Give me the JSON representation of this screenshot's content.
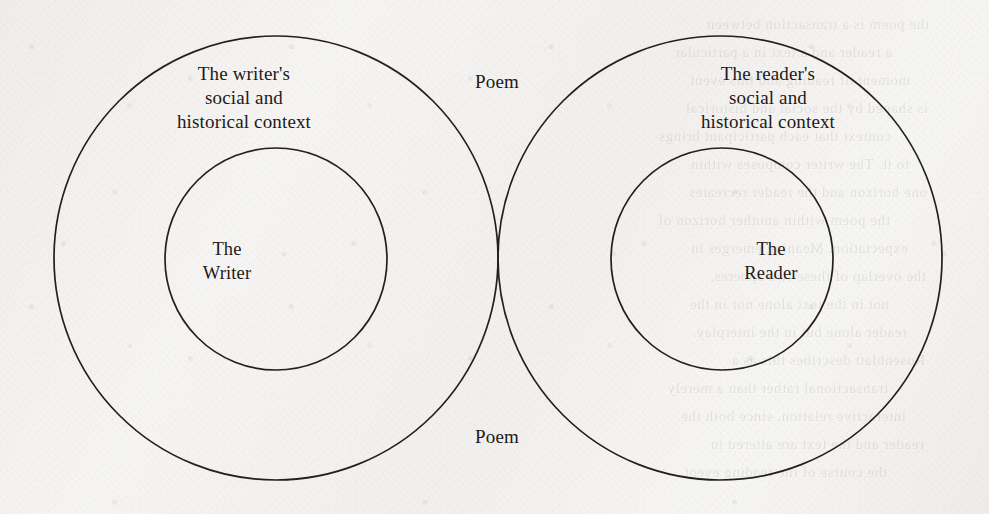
{
  "page": {
    "width": 989,
    "height": 514,
    "background_color": "#f3f2f0",
    "ink_color": "#23201e",
    "medium": "scanned book page"
  },
  "diagram": {
    "type": "venn-diagram",
    "title": "",
    "circles": [
      {
        "id": "writer-context",
        "label": "The writer's\nsocial and\nhistorical context",
        "cx": 276,
        "cy": 258,
        "r": 222,
        "role": "outer-left"
      },
      {
        "id": "reader-context",
        "label": "The reader's\nsocial and\nhistorical context",
        "cx": 720,
        "cy": 258,
        "r": 222,
        "role": "outer-right"
      },
      {
        "id": "writer",
        "label": "The\nWriter",
        "cx": 276,
        "cy": 259,
        "r": 111,
        "role": "inner-left"
      },
      {
        "id": "reader",
        "label": "The\nReader",
        "cx": 722,
        "cy": 259,
        "r": 111,
        "role": "inner-right"
      }
    ],
    "labels": [
      {
        "id": "writer-context-label",
        "text": "The writer's\nsocial and\nhistorical context",
        "x": 244,
        "y": 98
      },
      {
        "id": "poem-top-label",
        "text": "Poem",
        "x": 497,
        "y": 82
      },
      {
        "id": "reader-context-label",
        "text": "The reader's\nsocial and\nhistorical context",
        "x": 768,
        "y": 98
      },
      {
        "id": "writer-label",
        "text": "The\nWriter",
        "x": 227,
        "y": 261
      },
      {
        "id": "reader-label",
        "text": "The\nReader",
        "x": 771,
        "y": 261
      },
      {
        "id": "poem-bottom-label",
        "text": "Poem",
        "x": 497,
        "y": 437
      }
    ]
  },
  "showthrough": {
    "note": "faint mirrored text bleeding through from the reverse side of the printed page",
    "lines": [
      "the poem is a transaction between",
      "a reader and a text in a particular",
      "moment of reading and this event",
      "is shaped by the social and historical",
      "context that each participant brings",
      "to it. The writer composes within",
      "one horizon and the reader recreates",
      "the poem within another horizon of",
      "expectation. Meaning emerges in",
      "the overlap of these two spheres,",
      "not in the text alone nor in the",
      "reader alone but in the interplay.",
      "Rosenblatt describes this as a",
      "transactional rather than a merely",
      "interactive relation, since both the",
      "reader and the text are altered in",
      "the course of the reading event."
    ]
  }
}
